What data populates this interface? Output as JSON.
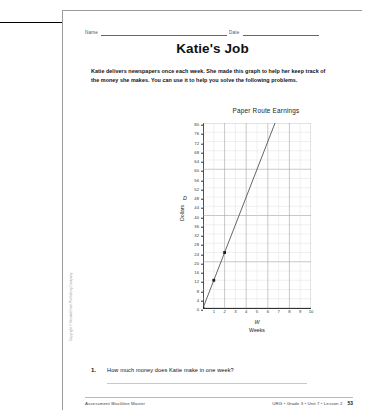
{
  "page": {
    "title": "Katie's Job",
    "intro": "Katie delivers newspapers once each week. She made this graph to help her keep track of the money she makes. You can use it to help you solve the following problems.",
    "copyright": "Copyright © Kendall Hunt Publishing Company"
  },
  "header": {
    "name_label": "Name",
    "date_label": "Date"
  },
  "question": {
    "number": "1.",
    "text": "How much money does Katie make in one week?"
  },
  "footer": {
    "left": "Assessment Blackline Master",
    "right": "URG • Grade 3 • Unit 7 • Lesson 2",
    "page": "53"
  },
  "chart_data": {
    "type": "line",
    "title": "Paper Route Earnings",
    "xlabel": "Weeks",
    "xvar": "W",
    "ylabel": "Dollars",
    "yvar": "D",
    "xlim": [
      0,
      10
    ],
    "ylim": [
      0,
      80
    ],
    "xticks": [
      1,
      2,
      3,
      4,
      5,
      6,
      7,
      8,
      9,
      10
    ],
    "yticks": [
      0,
      4,
      8,
      12,
      16,
      20,
      24,
      28,
      32,
      36,
      40,
      44,
      48,
      52,
      56,
      60,
      64,
      68,
      72,
      76,
      80
    ],
    "grid": true,
    "legend": "none",
    "slope_dollars_per_week": 12,
    "line": {
      "x_start": 0,
      "y_start": 0,
      "x_end": 6.67,
      "y_end": 80
    },
    "points": [
      {
        "x": 0,
        "y": 0
      },
      {
        "x": 1,
        "y": 12
      },
      {
        "x": 2,
        "y": 24
      }
    ],
    "colors": {
      "line": "#555555",
      "point": "#1a1a1a",
      "grid_minor": "#d8d8d8",
      "grid_major": "#9a9a9a",
      "axis": "#333333"
    }
  }
}
